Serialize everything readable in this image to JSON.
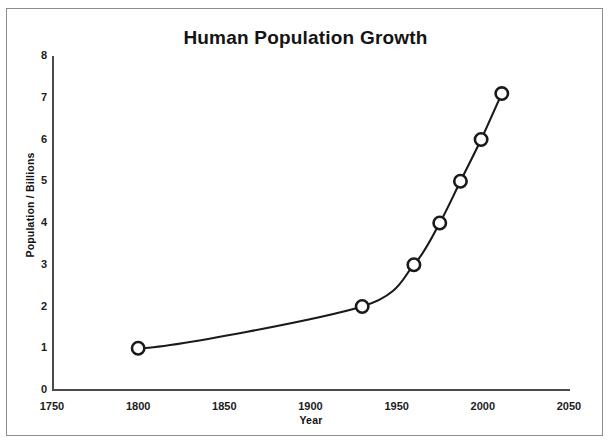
{
  "document": {
    "top_bleed_text": "",
    "figure_border_color": "#8c8c8c"
  },
  "chart_data": {
    "type": "line",
    "title": "Human Population Growth",
    "xlabel": "Year",
    "ylabel": "Population / Billions",
    "xlim": [
      1750,
      2050
    ],
    "ylim": [
      0,
      8
    ],
    "xticks": [
      1750,
      1800,
      1850,
      1900,
      1950,
      2000,
      2050
    ],
    "yticks": [
      0,
      1,
      2,
      3,
      4,
      5,
      6,
      7,
      8
    ],
    "grid": false,
    "legend": null,
    "marker": "open-circle",
    "line_color": "#1a1a1a",
    "series": [
      {
        "name": "World population",
        "x": [
          1800,
          1930,
          1960,
          1975,
          1987,
          1999,
          2011
        ],
        "values": [
          1.0,
          2.0,
          3.0,
          4.0,
          5.0,
          6.0,
          7.1
        ]
      }
    ],
    "points": [
      {
        "year": 1800,
        "population": 1.0
      },
      {
        "year": 1930,
        "population": 2.0
      },
      {
        "year": 1960,
        "population": 3.0
      },
      {
        "year": 1975,
        "population": 4.0
      },
      {
        "year": 1987,
        "population": 5.0
      },
      {
        "year": 1999,
        "population": 6.0
      },
      {
        "year": 2011,
        "population": 7.1
      }
    ]
  }
}
